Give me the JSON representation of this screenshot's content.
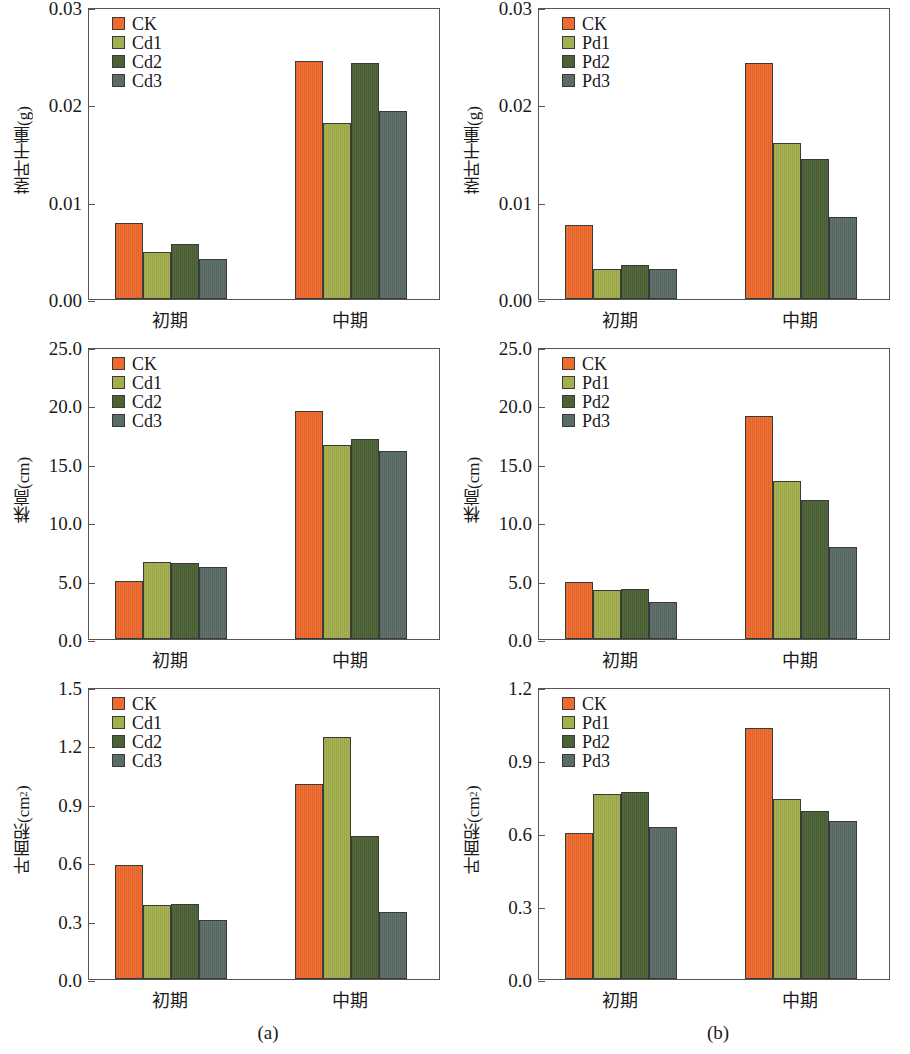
{
  "figure": {
    "subcaption_a": "(a)",
    "subcaption_b": "(b)"
  },
  "colors": {
    "ck": "#EE6B2D",
    "t1": "#A3AF4C",
    "t2": "#4C6234",
    "t3": "#5B6C66",
    "axis": "#555555",
    "bar_outline": "#3A3A3A"
  },
  "chart_data": [
    {
      "id": "a1",
      "type": "bar",
      "title": "",
      "xlabel": "",
      "ylabel": "茎叶干重(g)",
      "categories": [
        "初期",
        "中期"
      ],
      "ylim": [
        0,
        0.03
      ],
      "yticks": [
        0,
        0.01,
        0.02,
        0.03
      ],
      "ytick_labels": [
        "0.00",
        "0.01",
        "0.02",
        "0.03"
      ],
      "grid": false,
      "legend_position": "top-left",
      "series": [
        {
          "name": "CK",
          "values": [
            0.0078,
            0.0245
          ]
        },
        {
          "name": "Cd1",
          "values": [
            0.0048,
            0.0181
          ]
        },
        {
          "name": "Cd2",
          "values": [
            0.0057,
            0.0242
          ]
        },
        {
          "name": "Cd3",
          "values": [
            0.0041,
            0.0193
          ]
        }
      ]
    },
    {
      "id": "b1",
      "type": "bar",
      "title": "",
      "xlabel": "",
      "ylabel": "茎叶干重(g)",
      "categories": [
        "初期",
        "中期"
      ],
      "ylim": [
        0,
        0.03
      ],
      "yticks": [
        0,
        0.01,
        0.02,
        0.03
      ],
      "ytick_labels": [
        "0.00",
        "0.01",
        "0.02",
        "0.03"
      ],
      "grid": false,
      "legend_position": "top-left",
      "series": [
        {
          "name": "CK",
          "values": [
            0.0076,
            0.0242
          ]
        },
        {
          "name": "Pd1",
          "values": [
            0.0031,
            0.016
          ]
        },
        {
          "name": "Pd2",
          "values": [
            0.0035,
            0.0144
          ]
        },
        {
          "name": "Pd3",
          "values": [
            0.0031,
            0.0084
          ]
        }
      ]
    },
    {
      "id": "a2",
      "type": "bar",
      "title": "",
      "xlabel": "",
      "ylabel": "株高(cm)",
      "categories": [
        "初期",
        "中期"
      ],
      "ylim": [
        0,
        25.0
      ],
      "yticks": [
        0,
        5.0,
        10.0,
        15.0,
        20.0,
        25.0
      ],
      "ytick_labels": [
        "0.0",
        "5.0",
        "10.0",
        "15.0",
        "20.0",
        "25.0"
      ],
      "grid": false,
      "legend_position": "top-left",
      "series": [
        {
          "name": "CK",
          "values": [
            5.0,
            19.5
          ]
        },
        {
          "name": "Cd1",
          "values": [
            6.6,
            16.6
          ]
        },
        {
          "name": "Cd2",
          "values": [
            6.5,
            17.1
          ]
        },
        {
          "name": "Cd3",
          "values": [
            6.2,
            16.1
          ]
        }
      ]
    },
    {
      "id": "b2",
      "type": "bar",
      "title": "",
      "xlabel": "",
      "ylabel": "株高(cm)",
      "categories": [
        "初期",
        "中期"
      ],
      "ylim": [
        0,
        25.0
      ],
      "yticks": [
        0,
        5.0,
        10.0,
        15.0,
        20.0,
        25.0
      ],
      "ytick_labels": [
        "0.0",
        "5.0",
        "10.0",
        "15.0",
        "20.0",
        "25.0"
      ],
      "grid": false,
      "legend_position": "top-left",
      "series": [
        {
          "name": "CK",
          "values": [
            4.9,
            19.1
          ]
        },
        {
          "name": "Pd1",
          "values": [
            4.2,
            13.5
          ]
        },
        {
          "name": "Pd2",
          "values": [
            4.3,
            11.9
          ]
        },
        {
          "name": "Pd3",
          "values": [
            3.2,
            7.9
          ]
        }
      ]
    },
    {
      "id": "a3",
      "type": "bar",
      "title": "",
      "xlabel": "",
      "ylabel": "叶面积(cm2)",
      "ylabel_base": "叶面积(cm",
      "ylabel_sup": "2",
      "ylabel_tail": ")",
      "categories": [
        "初期",
        "中期"
      ],
      "ylim": [
        0,
        1.5
      ],
      "yticks": [
        0,
        0.3,
        0.6,
        0.9,
        1.2,
        1.5
      ],
      "ytick_labels": [
        "0.0",
        "0.3",
        "0.6",
        "0.9",
        "1.2",
        "1.5"
      ],
      "grid": false,
      "legend_position": "top-left",
      "series": [
        {
          "name": "CK",
          "values": [
            0.585,
            1.0
          ]
        },
        {
          "name": "Cd1",
          "values": [
            0.38,
            1.245
          ]
        },
        {
          "name": "Cd2",
          "values": [
            0.385,
            0.735
          ]
        },
        {
          "name": "Cd3",
          "values": [
            0.305,
            0.345
          ]
        }
      ]
    },
    {
      "id": "b3",
      "type": "bar",
      "title": "",
      "xlabel": "",
      "ylabel": "叶面积(cm2)",
      "ylabel_base": "叶面积(cm",
      "ylabel_sup": "2",
      "ylabel_tail": ")",
      "categories": [
        "初期",
        "中期"
      ],
      "ylim": [
        0,
        1.2
      ],
      "yticks": [
        0,
        0.3,
        0.6,
        0.9,
        1.2
      ],
      "ytick_labels": [
        "0.0",
        "0.3",
        "0.6",
        "0.9",
        "1.2"
      ],
      "grid": false,
      "legend_position": "top-left",
      "series": [
        {
          "name": "CK",
          "values": [
            0.6,
            1.03
          ]
        },
        {
          "name": "Pd1",
          "values": [
            0.76,
            0.74
          ]
        },
        {
          "name": "Pd2",
          "values": [
            0.77,
            0.69
          ]
        },
        {
          "name": "Pd3",
          "values": [
            0.625,
            0.65
          ]
        }
      ]
    }
  ]
}
